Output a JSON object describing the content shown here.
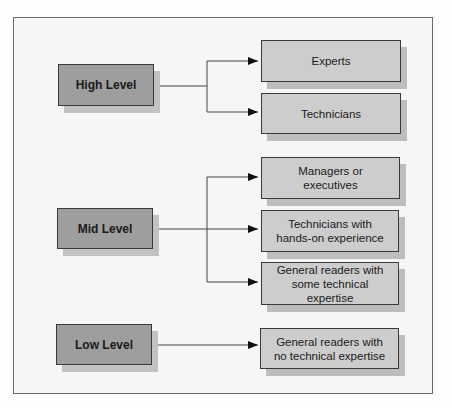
{
  "diagram": {
    "type": "audience-level-flow",
    "levels": [
      {
        "label": "High Level",
        "audiences": [
          "Experts",
          "Technicians"
        ]
      },
      {
        "label": "Mid Level",
        "audiences": [
          "Managers or executives",
          "Technicians with hands-on experience",
          "General readers with some technical expertise"
        ]
      },
      {
        "label": "Low Level",
        "audiences": [
          "General readers with no technical expertise"
        ]
      }
    ],
    "colors": {
      "level_box": "#9e9e9e",
      "audience_box": "#cdcdcd",
      "frame_border": "#6a6a6a",
      "line": "#3a3a3a"
    }
  }
}
